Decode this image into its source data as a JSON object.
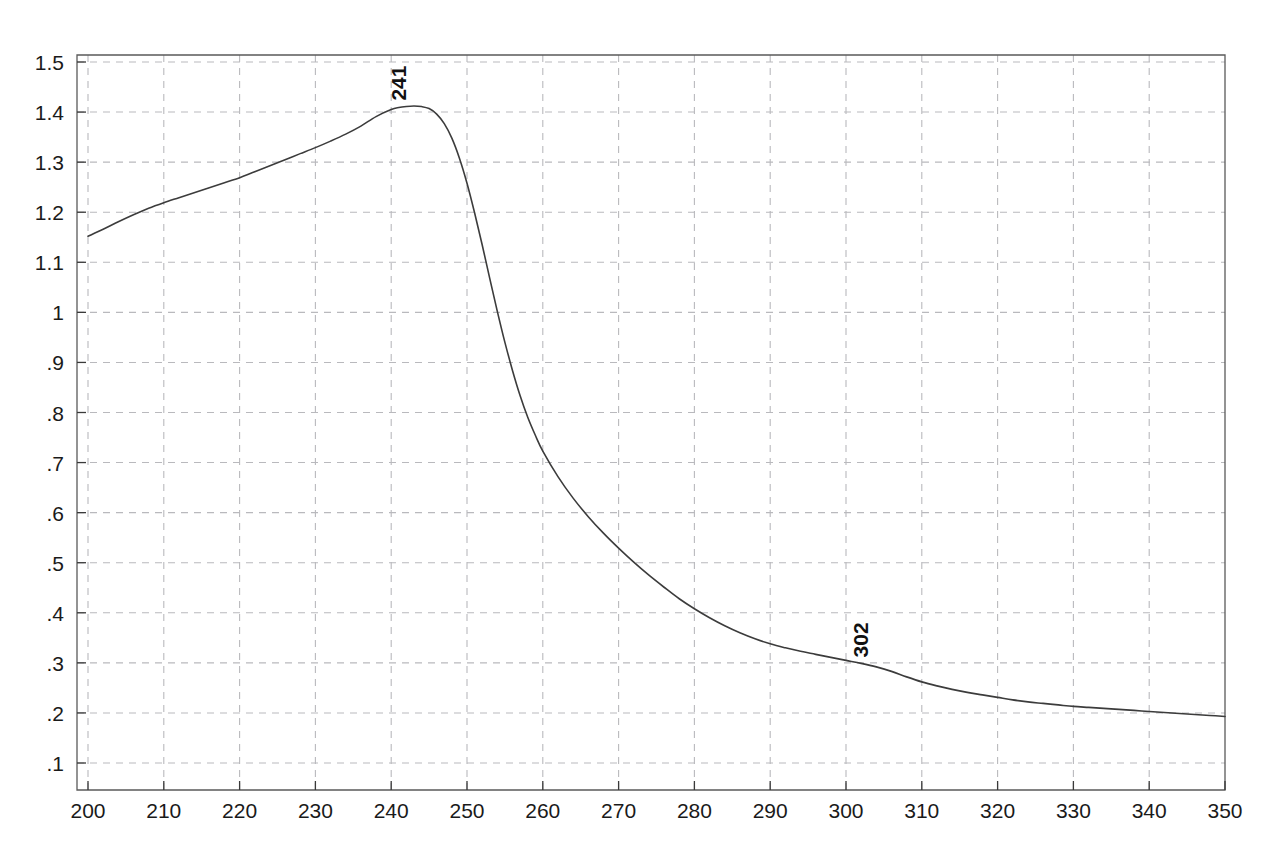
{
  "chart_data": {
    "type": "line",
    "title": "",
    "subtitle": "",
    "xlabel": "",
    "ylabel": "",
    "xlim": [
      200,
      350
    ],
    "ylim": [
      0.05,
      1.55
    ],
    "grid": true,
    "legend": null,
    "legend_position": "none",
    "x_ticks": [
      200,
      210,
      220,
      230,
      240,
      250,
      260,
      270,
      280,
      290,
      300,
      310,
      320,
      330,
      340,
      350
    ],
    "x_tick_labels": [
      "200",
      "210",
      "220",
      "230",
      "240",
      "250",
      "260",
      "270",
      "280",
      "290",
      "300",
      "310",
      "320",
      "330",
      "340",
      "350"
    ],
    "y_ticks": [
      0.1,
      0.2,
      0.3,
      0.4,
      0.5,
      0.6,
      0.7,
      0.8,
      0.9,
      1.0,
      1.1,
      1.2,
      1.3,
      1.4,
      1.5
    ],
    "y_tick_labels": [
      ".1",
      ".2",
      ".3",
      ".4",
      ".5",
      ".6",
      ".7",
      ".8",
      ".9",
      "1",
      "1.1",
      "1.2",
      "1.3",
      "1.4",
      "1.5"
    ],
    "series": [
      {
        "name": "absorbance",
        "color": "#3c3c3c",
        "x": [
          200,
          202,
          204,
          206,
          208,
          210,
          212,
          214,
          216,
          218,
          220,
          222,
          224,
          226,
          228,
          230,
          232,
          234,
          236,
          238,
          240,
          241,
          242,
          243,
          244,
          245,
          246,
          247,
          248,
          249,
          250,
          251,
          252,
          253,
          254,
          255,
          256,
          257,
          258,
          259,
          260,
          262,
          264,
          266,
          268,
          270,
          272,
          274,
          276,
          278,
          280,
          282,
          284,
          286,
          288,
          290,
          292,
          294,
          296,
          298,
          300,
          302,
          304,
          306,
          308,
          310,
          312,
          314,
          316,
          318,
          320,
          322,
          324,
          326,
          328,
          330,
          332,
          334,
          336,
          338,
          340,
          342,
          344,
          346,
          348,
          350
        ],
        "y": [
          1.152,
          1.166,
          1.181,
          1.195,
          1.208,
          1.219,
          1.229,
          1.239,
          1.249,
          1.259,
          1.269,
          1.281,
          1.293,
          1.305,
          1.317,
          1.329,
          1.342,
          1.356,
          1.372,
          1.391,
          1.405,
          1.409,
          1.411,
          1.412,
          1.411,
          1.407,
          1.396,
          1.377,
          1.348,
          1.308,
          1.258,
          1.199,
          1.135,
          1.068,
          1.002,
          0.94,
          0.884,
          0.834,
          0.791,
          0.755,
          0.723,
          0.672,
          0.629,
          0.592,
          0.559,
          0.529,
          0.501,
          0.475,
          0.451,
          0.428,
          0.408,
          0.39,
          0.374,
          0.36,
          0.348,
          0.338,
          0.33,
          0.323,
          0.317,
          0.311,
          0.305,
          0.299,
          0.292,
          0.283,
          0.272,
          0.262,
          0.254,
          0.247,
          0.241,
          0.236,
          0.231,
          0.226,
          0.222,
          0.219,
          0.216,
          0.213,
          0.211,
          0.209,
          0.207,
          0.205,
          0.203,
          0.201,
          0.199,
          0.197,
          0.195,
          0.193
        ]
      }
    ],
    "annotations": [
      {
        "name": "peak-241",
        "text": "241",
        "x": 241,
        "y": 1.411,
        "rotation": -90
      },
      {
        "name": "peak-302",
        "text": "302",
        "x": 302,
        "y": 0.299,
        "rotation": -90
      }
    ]
  }
}
